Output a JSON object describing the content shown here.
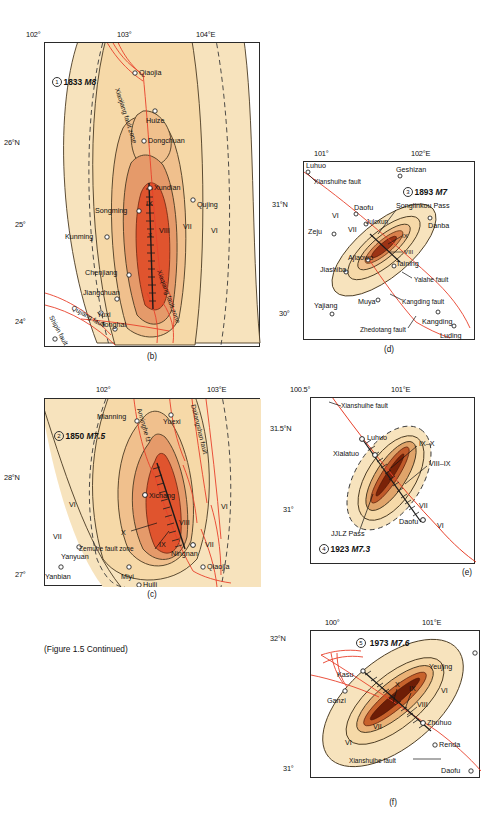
{
  "figure": {
    "caption": "(Figure 1.5 Continued)",
    "colors": {
      "zone_vi": "#f7e3bd",
      "zone_vii": "#f6d9a8",
      "zone_viii": "#f0c08d",
      "zone_ix": "#e59a6a",
      "zone_x": "#d9603a",
      "zone_xi": "#b23a1e",
      "fault_red": "#e8402a",
      "outline": "#2a2a2a"
    }
  },
  "panels": [
    {
      "id": "b",
      "caption": "(b)",
      "event": {
        "number": "1",
        "year": "1833",
        "magnitude": "M8"
      },
      "axis": {
        "top_ticks": [
          "102°",
          "103°",
          "104°E"
        ],
        "left_ticks": [
          "26°N",
          "25°",
          "24°"
        ]
      },
      "places": [
        "Qiaojia",
        "Huize",
        "Dongchuan",
        "Xundian",
        "Qujing",
        "Songming",
        "Kunming",
        "Chenjiang",
        "Jiangchuan",
        "Yuxi",
        "Tonghai"
      ],
      "faults": [
        "Xiaojiang fault zone",
        "Xiaqiang fault zone",
        "Qujiang fault",
        "Shipin fault"
      ],
      "intensities": [
        "IX",
        "X",
        "VIII",
        "VII",
        "VI"
      ]
    },
    {
      "id": "c",
      "caption": "(c)",
      "event": {
        "number": "2",
        "year": "1850",
        "magnitude": "M7.5"
      },
      "axis": {
        "top_ticks": [
          "102°",
          "103°E"
        ],
        "left_ticks": [
          "28°N",
          "27°"
        ]
      },
      "places": [
        "Mianning",
        "Yuexi",
        "Xichang",
        "Yanyuan",
        "Ningnan",
        "Qiaojia",
        "Yanbian",
        "Miyi",
        "Huili"
      ],
      "faults": [
        "Anninghe fz",
        "Daliangshan fault",
        "Zemuhe fault zone"
      ],
      "intensities": [
        "X",
        "IX",
        "VIII",
        "VII",
        "VI"
      ]
    },
    {
      "id": "d",
      "caption": "(d)",
      "event": {
        "number": "3",
        "year": "1893",
        "magnitude": "M7"
      },
      "axis": {
        "top_ticks": [
          "101°",
          "102°E"
        ],
        "left_ticks": [
          "31°N",
          "30°"
        ]
      },
      "places": [
        "Luhuo",
        "Geshizan",
        "Daofu",
        "Juloxun",
        "Danba",
        "Zeju",
        "Ajiaowo",
        "Taining",
        "Jiashiba",
        "Muya",
        "Yajiang",
        "Kangding",
        "Luding",
        "Songlinkou Pass"
      ],
      "faults": [
        "Xianshuihe fault",
        "Yalahe fault",
        "Kangding fault",
        "Zhedotang fault"
      ],
      "intensities": [
        "VI",
        "VII",
        "VIII",
        "IX"
      ]
    },
    {
      "id": "e",
      "caption": "(e)",
      "event": {
        "number": "4",
        "year": "1923",
        "magnitude": "M7.3"
      },
      "axis": {
        "top_ticks": [
          "100.5°",
          "101°E"
        ],
        "left_ticks": [
          "31.5°N",
          "31°"
        ]
      },
      "places": [
        "Luhuo",
        "Xialatuo",
        "Daofu",
        "JJLZ Pass"
      ],
      "faults": [
        "Xianshuihe fault"
      ],
      "intensities": [
        "IX–X",
        "VIII–IX",
        "VII",
        "VI"
      ]
    },
    {
      "id": "f",
      "caption": "(f)",
      "event": {
        "number": "5",
        "year": "1973",
        "magnitude": "M7.6"
      },
      "axis": {
        "top_ticks": [
          "100°",
          "101°E"
        ],
        "left_ticks": [
          "32°N",
          "31°"
        ]
      },
      "places": [
        "Kasu",
        "Ganzi",
        "Yeujing",
        "Zhuhuo",
        "Renda",
        "Daofu"
      ],
      "faults": [
        "Xianshuihe fault"
      ],
      "intensities": [
        "X",
        "IX",
        "VIII",
        "VII",
        "VI"
      ]
    }
  ]
}
